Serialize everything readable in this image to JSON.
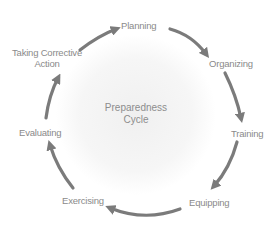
{
  "diagram": {
    "title": "Preparedness Cycle",
    "center_lines": [
      "Preparedness",
      "Cycle"
    ],
    "stages": [
      {
        "label": "Planning"
      },
      {
        "label": "Organizing"
      },
      {
        "label": "Training"
      },
      {
        "label": "Equipping"
      },
      {
        "label": "Exercising"
      },
      {
        "label": "Evaluating"
      },
      {
        "label": "Taking Corrective Action",
        "lines": [
          "Taking Corrective",
          "Action"
        ]
      }
    ],
    "flow": "clockwise",
    "colors": {
      "arrow": "#7b7b7b",
      "text": "#8a8a8a",
      "center_glow": "#eeeeee"
    }
  }
}
